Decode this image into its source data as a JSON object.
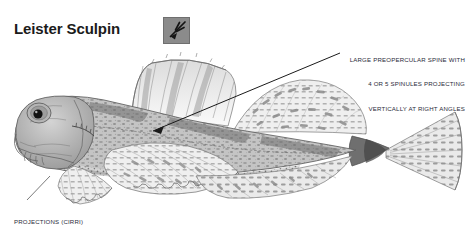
{
  "page": {
    "width": 468,
    "height": 237,
    "background": "#ffffff"
  },
  "title": {
    "text": "Leister Sculpin",
    "color": "#1b1b1b"
  },
  "badge": {
    "icon_name": "leister-spear-icon",
    "fill": "#8b8b8b",
    "border": "#6f6f6f",
    "stroke": "#1a1a1a",
    "description": "gray square badge with dark leister (fishing spear) pointing down-left"
  },
  "annotations": [
    {
      "id": "preopercular",
      "align": "right",
      "lines": [
        "LARGE PREOPERCULAR SPINE WITH",
        "4 OR 5 SPINULES PROJECTING",
        "VERTICALLY AT RIGHT ANGLES"
      ],
      "color": "#2b2b3a"
    },
    {
      "id": "cirri",
      "align": "left",
      "lines": [
        "PROJECTIONS (CIRRI)",
        "AT CORNER OF MOUTH"
      ],
      "color": "#2b2b3a"
    }
  ],
  "leaders": [
    {
      "id": "preopercular-leader",
      "from": [
        340,
        53
      ],
      "to": [
        152,
        131
      ],
      "arrowhead": true,
      "color": "#1a1a1a"
    },
    {
      "id": "cirri-leader",
      "from": [
        27,
        200
      ],
      "to": [
        50,
        176
      ],
      "arrowhead": false,
      "color": "#6a6a6a"
    }
  ],
  "illustration": {
    "name": "leister-sculpin-drawing",
    "style": "grayscale pencil / stipple scientific illustration",
    "ink": "#5a5a5a",
    "body_fill": "#c9c9c9",
    "fin_fill": "#e4e4e4",
    "parts": [
      {
        "name": "head",
        "detail": "broad blunt head with large dark eye high on skull"
      },
      {
        "name": "eye",
        "detail": "large round eye with solid black pupil and mottled iris ring"
      },
      {
        "name": "mouth-cirri",
        "detail": "small fleshy projections at corner of mouth"
      },
      {
        "name": "preopercular-spine",
        "detail": "large spine with 4 or 5 vertical spinules"
      },
      {
        "name": "first-dorsal-fin",
        "detail": "spiny fin with vertical striations"
      },
      {
        "name": "second-dorsal-fin",
        "detail": "long soft-rayed fin with dark banded blotches"
      },
      {
        "name": "pectoral-fin",
        "detail": "large fan-shaped fin with banded rays and scalloped margin"
      },
      {
        "name": "pelvic-fin",
        "detail": "small lower fin with banded rays"
      },
      {
        "name": "anal-fin",
        "detail": "elongate lower fin with banded rays"
      },
      {
        "name": "caudal-peduncle",
        "detail": "narrow dark tail base"
      },
      {
        "name": "caudal-fin",
        "detail": "broad fan tail with banded rays"
      },
      {
        "name": "body",
        "detail": "mottled and blotched grey body with saddle markings"
      }
    ]
  }
}
